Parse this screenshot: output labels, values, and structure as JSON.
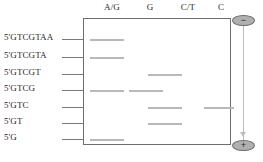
{
  "figure": {
    "type": "gel-electrophoresis-diagram"
  },
  "lanes": [
    {
      "id": "lane-ag",
      "label": "A/G",
      "center_x": 112
    },
    {
      "id": "lane-g",
      "label": "G",
      "center_x": 150
    },
    {
      "id": "lane-ct",
      "label": "C/T",
      "center_x": 188
    },
    {
      "id": "lane-c",
      "label": "C",
      "center_x": 221
    }
  ],
  "rows": [
    {
      "id": "row-1",
      "label": "5'GTCGTAA",
      "y": 39
    },
    {
      "id": "row-2",
      "label": "5'GTCGTA",
      "y": 57
    },
    {
      "id": "row-3",
      "label": "5'GTCGT",
      "y": 74
    },
    {
      "id": "row-4",
      "label": "5'GTCG",
      "y": 90
    },
    {
      "id": "row-5",
      "label": "5'GTC",
      "y": 107
    },
    {
      "id": "row-6",
      "label": "5'GT",
      "y": 123
    },
    {
      "id": "row-7",
      "label": "5'G",
      "y": 139
    }
  ],
  "bands": [
    {
      "id": "band-ag-1",
      "lane": "A/G",
      "row": "5'GTCGTAA",
      "x": 90,
      "width": 34,
      "y": 39
    },
    {
      "id": "band-ag-2",
      "lane": "A/G",
      "row": "5'GTCGTA",
      "x": 90,
      "width": 34,
      "y": 57
    },
    {
      "id": "band-ct-3",
      "lane": "C/T",
      "row": "5'GTCGT",
      "x": 148,
      "width": 34,
      "y": 74
    },
    {
      "id": "band-ag-4",
      "lane": "A/G",
      "row": "5'GTCG",
      "x": 90,
      "width": 34,
      "y": 90
    },
    {
      "id": "band-g-4",
      "lane": "G",
      "row": "5'GTCG",
      "x": 129,
      "width": 34,
      "y": 90
    },
    {
      "id": "band-ct-5",
      "lane": "C/T",
      "row": "5'GTC",
      "x": 148,
      "width": 34,
      "y": 107
    },
    {
      "id": "band-c-5",
      "lane": "C",
      "row": "5'GTC",
      "x": 204,
      "width": 30,
      "y": 107
    },
    {
      "id": "band-ct-6",
      "lane": "C/T",
      "row": "5'GT",
      "x": 148,
      "width": 34,
      "y": 123
    },
    {
      "id": "band-ag-7",
      "lane": "A/G",
      "row": "5'G",
      "x": 90,
      "width": 34,
      "y": 139
    }
  ],
  "electrodes": {
    "negative": {
      "symbol": "−",
      "name": "negative-electrode",
      "position": "top"
    },
    "positive": {
      "symbol": "+",
      "name": "positive-electrode",
      "position": "bottom"
    }
  },
  "colors": {
    "band": "#b9b9b9",
    "box_border": "#6e6e6e",
    "tick": "#7a7a7a",
    "wire": "#bdbdbd",
    "electrode_fill": "#b0b0b0",
    "text": "#1f1f1f",
    "background": "#ffffff"
  }
}
